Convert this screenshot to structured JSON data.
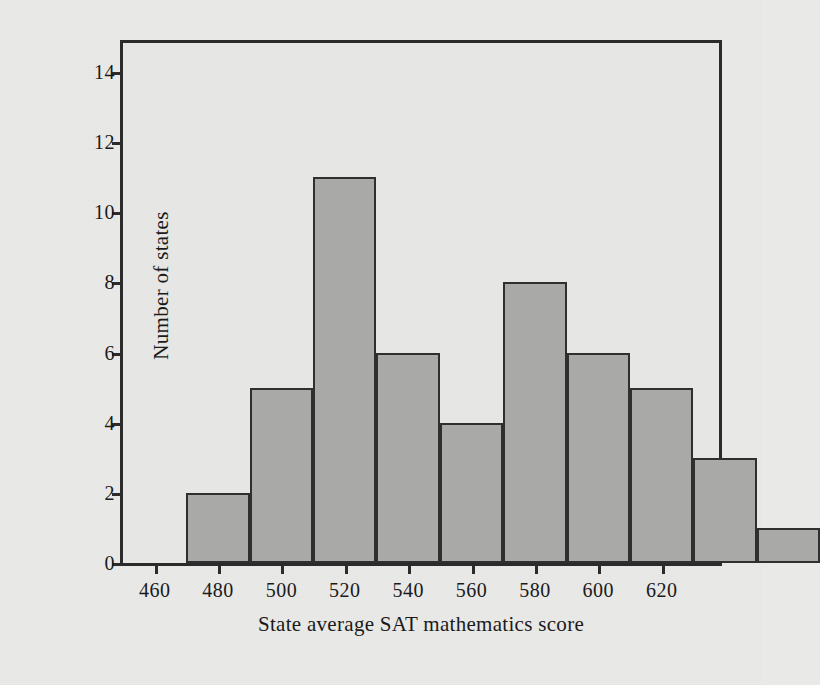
{
  "figure": {
    "background_color": "#e9e9e7",
    "plot_background_color": "#e6e6e4",
    "frame_color": "#2b2b2b",
    "bar_fill_color": "#a9a9a7",
    "bar_edge_color": "#2f2f2f"
  },
  "chart_data": {
    "type": "bar",
    "title": "",
    "subtitle": "",
    "xlabel": "State average SAT mathematics score",
    "ylabel": "Number of states",
    "xlim": [
      450,
      640
    ],
    "ylim": [
      0,
      15
    ],
    "xticks": [
      460,
      480,
      500,
      520,
      540,
      560,
      580,
      600,
      620
    ],
    "xtick_labels": [
      "460",
      "480",
      "500",
      "520",
      "540",
      "560",
      "580",
      "600",
      "620"
    ],
    "yticks": [
      0,
      2,
      4,
      6,
      8,
      10,
      12,
      14
    ],
    "ytick_labels": [
      "0",
      "2",
      "4",
      "6",
      "8",
      "10",
      "12",
      "14"
    ],
    "grid": false,
    "legend": null,
    "bin_width": 10,
    "bin_edges": [
      470,
      480,
      490,
      500,
      510,
      520,
      530,
      540,
      550,
      560,
      570,
      580,
      590,
      600,
      610
    ],
    "categories": [
      "470-480",
      "480-490",
      "490-500",
      "500-510",
      "510-520",
      "520-530",
      "530-540",
      "540-550",
      "550-560",
      "560-570",
      "570-580",
      "580-590",
      "590-600",
      "600-610"
    ],
    "values": [
      2,
      2,
      5,
      5,
      11,
      11,
      6,
      6,
      4,
      4,
      8,
      8,
      6,
      6
    ],
    "bars": [
      {
        "x0": 470,
        "x1": 490,
        "count": 2
      },
      {
        "x0": 490,
        "x1": 510,
        "count": 5
      },
      {
        "x0": 510,
        "x1": 530,
        "count": 11
      },
      {
        "x0": 530,
        "x1": 550,
        "count": 6
      },
      {
        "x0": 550,
        "x1": 570,
        "count": 4
      },
      {
        "x0": 570,
        "x1": 590,
        "count": 8
      },
      {
        "x0": 590,
        "x1": 610,
        "count": 6
      }
    ],
    "bars_rendered": [
      {
        "x0": 470,
        "x1": 490,
        "count": 2
      },
      {
        "x0": 490,
        "x1": 510,
        "count": 5
      },
      {
        "x0": 510,
        "x1": 530,
        "count": 11
      },
      {
        "x0": 530,
        "x1": 550,
        "count": 6
      },
      {
        "x0": 550,
        "x1": 570,
        "count": 4
      },
      {
        "x0": 570,
        "x1": 590,
        "count": 8
      },
      {
        "x0": 590,
        "x1": 610,
        "count": 6
      },
      {
        "x0": 610,
        "x1": 630,
        "count": 5
      },
      {
        "x0": 630,
        "x1": 650,
        "count": 3
      },
      {
        "x0": 650,
        "x1": 670,
        "count": 1
      }
    ],
    "histogram": [
      {
        "bin_start": 470,
        "bin_end": 490,
        "count": 2
      },
      {
        "bin_start": 490,
        "bin_end": 510,
        "count": 5
      },
      {
        "bin_start": 510,
        "bin_end": 530,
        "count": 11
      },
      {
        "bin_start": 530,
        "bin_end": 550,
        "count": 6
      },
      {
        "bin_start": 550,
        "bin_end": 570,
        "count": 4
      },
      {
        "bin_start": 570,
        "bin_end": 590,
        "count": 8
      },
      {
        "bin_start": 590,
        "bin_end": 610,
        "count": 6
      },
      {
        "bin_start": 610,
        "bin_end": 630,
        "count": 5
      },
      {
        "bin_start": 630,
        "bin_end": 650,
        "count": 3
      },
      {
        "bin_start": 650,
        "bin_end": 670,
        "count": 1
      }
    ],
    "plot_bars": [
      {
        "left": 470,
        "right": 490,
        "height": 2
      },
      {
        "left": 490,
        "right": 510,
        "height": 5
      },
      {
        "left": 510,
        "right": 530,
        "height": 11
      },
      {
        "left": 530,
        "right": 550,
        "height": 6
      },
      {
        "left": 550,
        "right": 570,
        "height": 4
      },
      {
        "left": 570,
        "right": 590,
        "height": 8
      },
      {
        "left": 590,
        "right": 610,
        "height": 6
      },
      {
        "left": 610,
        "right": 630,
        "height": 5
      },
      {
        "left": 630,
        "right": 650,
        "height": 3
      },
      {
        "left": 650,
        "right": 670,
        "height": 1
      }
    ]
  }
}
